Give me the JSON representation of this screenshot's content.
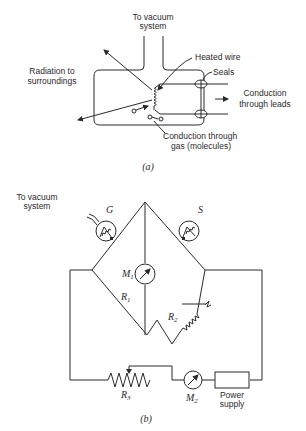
{
  "figure_a": {
    "caption": "(a)",
    "labels": {
      "vacuum_line1": "To vacuum",
      "vacuum_line2": "system",
      "heated_wire": "Heated wire",
      "seals": "Seals",
      "radiation_line1": "Radiation to",
      "radiation_line2": "surroundings",
      "leads_line1": "Conduction",
      "leads_line2": "through leads",
      "gas_line1": "Conduction through",
      "gas_line2": "gas (molecules)"
    }
  },
  "figure_b": {
    "caption": "(b)",
    "labels": {
      "vacuum_line1": "To vacuum",
      "vacuum_line2": "system",
      "gauge_tube": "G",
      "sealed_tube": "S",
      "meter1": "M",
      "meter1_sub": "1",
      "meter2": "M",
      "meter2_sub": "2",
      "resistor1": "R",
      "resistor1_sub": "1",
      "resistor2": "R",
      "resistor2_sub": "2",
      "resistor3": "R",
      "resistor3_sub": "3",
      "power_line1": "Power",
      "power_line2": "supply"
    }
  }
}
